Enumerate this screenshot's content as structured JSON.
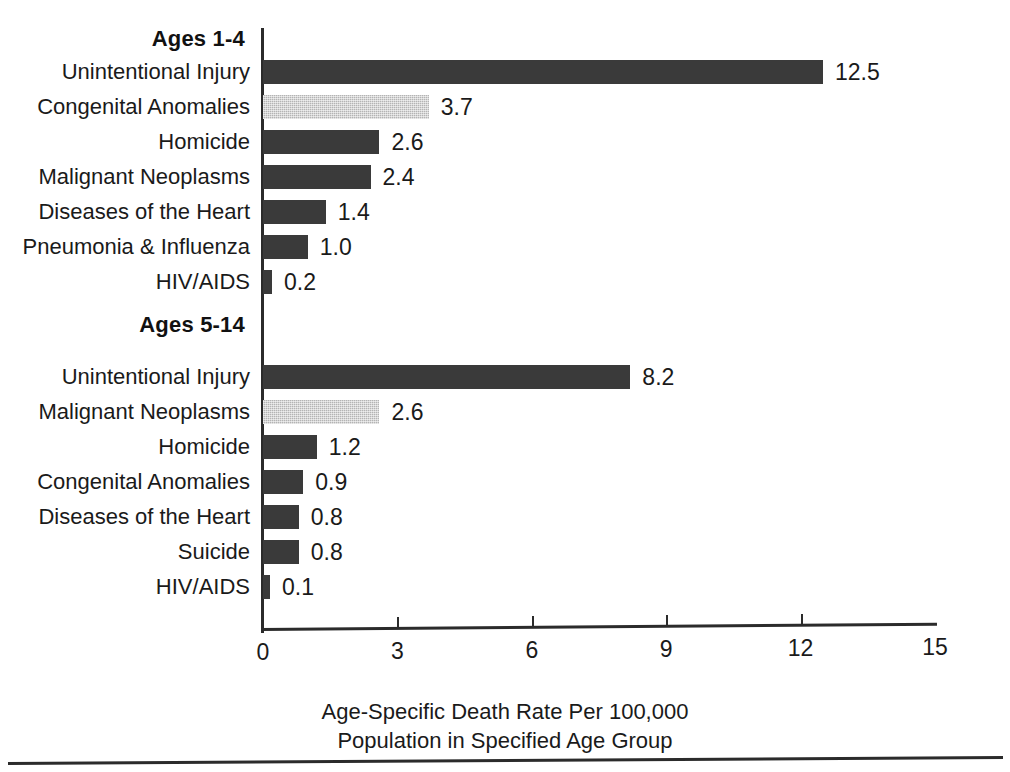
{
  "chart_data": {
    "type": "bar",
    "orientation": "horizontal",
    "title": "",
    "xlabel": "Age-Specific Death Rate Per 100,000 Population in Specified Age Group",
    "ylabel": "",
    "xlim": [
      0,
      15
    ],
    "xticks": [
      0,
      3,
      6,
      9,
      12,
      15
    ],
    "xtick_labels": [
      "0",
      "3",
      "6",
      "9",
      "12",
      "15"
    ],
    "grid": false,
    "legend": "none",
    "groups": [
      {
        "heading": "Ages 1-4",
        "categories": [
          "Unintentional Injury",
          "Congenital Anomalies",
          "Homicide",
          "Malignant Neoplasms",
          "Diseases of the Heart",
          "Pneumonia & Influenza",
          "HIV/AIDS"
        ],
        "values": [
          12.5,
          3.7,
          2.6,
          2.4,
          1.4,
          1.0,
          0.2
        ],
        "value_labels": [
          "12.5",
          "3.7",
          "2.6",
          "2.4",
          "1.4",
          "1.0",
          "0.2"
        ],
        "highlight_index": 1
      },
      {
        "heading": "Ages 5-14",
        "categories": [
          "Unintentional Injury",
          "Malignant Neoplasms",
          "Homicide",
          "Congenital Anomalies",
          "Diseases of the Heart",
          "Suicide",
          "HIV/AIDS"
        ],
        "values": [
          8.2,
          2.6,
          1.2,
          0.9,
          0.8,
          0.8,
          0.1
        ],
        "value_labels": [
          "8.2",
          "2.6",
          "1.2",
          "0.9",
          "0.8",
          "0.8",
          "0.1"
        ],
        "highlight_index": 1
      }
    ],
    "colors": {
      "bar_dark": "#3a3a3a",
      "bar_light": "#b4b4b4",
      "axis": "#2b2b2b",
      "text": "#1a1a1a",
      "background": "#ffffff"
    }
  },
  "caption": {
    "line1": "Age-Specific Death Rate Per 100,000",
    "line2": "Population in Specified Age Group"
  }
}
